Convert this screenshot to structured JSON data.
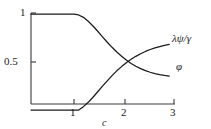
{
  "chart_data": {
    "type": "line",
    "title": "",
    "subtitle": "",
    "xlabel": "c",
    "ylabel": "",
    "xlim": [
      0,
      3.05
    ],
    "ylim": [
      0,
      1.06
    ],
    "grid": false,
    "legend_position": "inline-right-of-curve-ends",
    "x_ticks": [
      {
        "value": 1,
        "label": "1"
      },
      {
        "value": 2,
        "label": "2"
      },
      {
        "value": 3,
        "label": "3"
      }
    ],
    "y_ticks": [
      {
        "value": 0.5,
        "label": "0.5"
      },
      {
        "value": 1,
        "label": "1"
      }
    ],
    "annotations": [
      {
        "text": "crossing of the two curves near c = 2, value ≈ 0.47"
      }
    ],
    "series": [
      {
        "name": "φ",
        "label": "φ",
        "color": "#1a1a1a",
        "label_x": 2.95,
        "label_y": 0.4,
        "x": [
          0.0,
          0.2,
          0.4,
          0.6,
          0.8,
          0.9,
          1.0,
          1.1,
          1.2,
          1.3,
          1.4,
          1.5,
          1.6,
          1.7,
          1.8,
          1.9,
          2.0,
          2.1,
          2.2,
          2.3,
          2.4,
          2.5,
          2.6,
          2.7,
          2.8,
          2.9
        ],
        "y": [
          1.0,
          1.0,
          1.0,
          1.0,
          1.0,
          0.998,
          0.99,
          0.965,
          0.925,
          0.875,
          0.82,
          0.762,
          0.706,
          0.653,
          0.604,
          0.56,
          0.52,
          0.485,
          0.456,
          0.431,
          0.41,
          0.393,
          0.379,
          0.368,
          0.36,
          0.354
        ]
      },
      {
        "name": "λψ/γ",
        "label": "λψ/γ",
        "color": "#1a1a1a",
        "label_x": 2.95,
        "label_y": 0.74,
        "x": [
          0.0,
          0.2,
          0.4,
          0.6,
          0.8,
          0.9,
          1.0,
          1.1,
          1.2,
          1.3,
          1.4,
          1.5,
          1.6,
          1.7,
          1.8,
          1.9,
          2.0,
          2.1,
          2.2,
          2.3,
          2.4,
          2.5,
          2.6,
          2.7,
          2.8,
          2.9
        ],
        "y": [
          0.0,
          0.0,
          0.0,
          0.0,
          0.0,
          0.0,
          0.0,
          0.035,
          0.08,
          0.133,
          0.19,
          0.248,
          0.304,
          0.358,
          0.408,
          0.452,
          0.492,
          0.528,
          0.559,
          0.586,
          0.61,
          0.63,
          0.647,
          0.661,
          0.673,
          0.683
        ]
      }
    ]
  },
  "axes": {
    "x_axis_label": "c",
    "y_tick_1": "1",
    "y_tick_05": "0.5",
    "x_tick_1": "1",
    "x_tick_2": "2",
    "x_tick_3": "3"
  },
  "curve_labels": {
    "lambda_psi_gamma": "λψ/γ",
    "phi": "φ"
  },
  "colors": {
    "ink": "#1a1a1a",
    "axis": "#3a3a3a",
    "background": "#ffffff"
  }
}
